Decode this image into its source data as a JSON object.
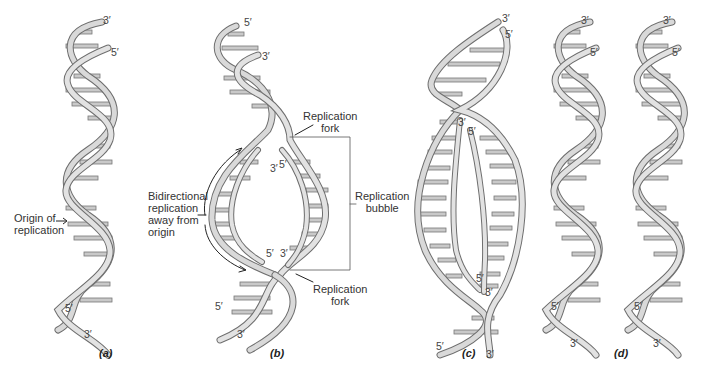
{
  "figure": {
    "panels": [
      {
        "id": "a",
        "caption": "(a)",
        "ends": {
          "top_left": "3′",
          "top_right": "5′",
          "bottom_left": "5′",
          "bottom_right": "3′"
        }
      },
      {
        "id": "b",
        "caption": "(b)",
        "ends": {
          "top_left": "5′",
          "top_right": "3′",
          "inner_top_left": "3′",
          "inner_top_right": "5′",
          "inner_bottom_left": "5′",
          "inner_bottom_right": "3′",
          "bottom_left": "5′",
          "bottom_right": "3′"
        }
      },
      {
        "id": "c",
        "caption": "(c)",
        "ends": {
          "top_left": "3′",
          "top_right": "5′",
          "inner_top_left": "3′",
          "inner_top_right": "5′",
          "inner_bottom_left": "5′",
          "inner_bottom_right": "3′",
          "bottom_left": "5′",
          "bottom_right": "3′"
        }
      },
      {
        "id": "d",
        "caption": "(d)",
        "ends": {
          "h1_top_left": "3′",
          "h1_top_right": "5′",
          "h1_bottom_left": "5′",
          "h1_bottom_right": "3′",
          "h2_top_left": "3′",
          "h2_top_right": "5′",
          "h2_bottom_left": "5′",
          "h2_bottom_right": "3′"
        }
      }
    ],
    "labels": {
      "origin_line1": "Origin of",
      "origin_line2": "replication",
      "bidirectional_line1": "Bidirectional",
      "bidirectional_line2": "replication",
      "bidirectional_line3": "away from",
      "bidirectional_line4": "origin",
      "fork_top_line1": "Replication",
      "fork_top_line2": "fork",
      "bubble_line1": "Replication",
      "bubble_line2": "bubble",
      "fork_bottom_line1": "Replication",
      "fork_bottom_line2": "fork"
    },
    "colors": {
      "strand_fill": "#d6d6d6",
      "strand_edge": "#6e6e6e",
      "rung": "#bdbdbd",
      "text": "#333333"
    }
  }
}
